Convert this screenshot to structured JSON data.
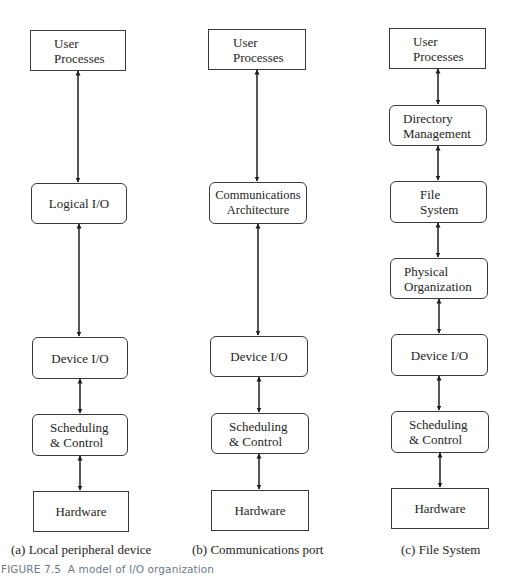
{
  "figure": {
    "caption_label": "FIGURE 7.5",
    "caption_text": "A model of I/O organization",
    "caption_color": "#6b7a8c"
  },
  "columns": [
    {
      "id": "a",
      "subcaption": "(a) Local peripheral device",
      "layers": [
        {
          "line1": "User",
          "line2": "Processes",
          "shape": "square"
        },
        {
          "line1": "Logical I/O",
          "line2": "",
          "shape": "rounded"
        },
        {
          "line1": "Device I/O",
          "line2": "",
          "shape": "rounded"
        },
        {
          "line1": "Scheduling",
          "line2": "& Control",
          "shape": "rounded"
        },
        {
          "line1": "Hardware",
          "line2": "",
          "shape": "square"
        }
      ]
    },
    {
      "id": "b",
      "subcaption": "(b) Communications port",
      "layers": [
        {
          "line1": "User",
          "line2": "Processes",
          "shape": "square"
        },
        {
          "line1": "Communications",
          "line2": "Architecture",
          "shape": "rounded"
        },
        {
          "line1": "Device I/O",
          "line2": "",
          "shape": "rounded"
        },
        {
          "line1": "Scheduling",
          "line2": "& Control",
          "shape": "rounded"
        },
        {
          "line1": "Hardware",
          "line2": "",
          "shape": "square"
        }
      ]
    },
    {
      "id": "c",
      "subcaption": "(c) File System",
      "layers": [
        {
          "line1": "User",
          "line2": "Processes",
          "shape": "square"
        },
        {
          "line1": "Directory",
          "line2": "Management",
          "shape": "rounded"
        },
        {
          "line1": "File",
          "line2": "System",
          "shape": "rounded"
        },
        {
          "line1": "Physical",
          "line2": "Organization",
          "shape": "rounded"
        },
        {
          "line1": "Device I/O",
          "line2": "",
          "shape": "rounded"
        },
        {
          "line1": "Scheduling",
          "line2": "& Control",
          "shape": "rounded"
        },
        {
          "line1": "Hardware",
          "line2": "",
          "shape": "square"
        }
      ]
    }
  ],
  "connectors": {
    "type": "bidirectional-arrow",
    "color": "#1e1e1e"
  }
}
